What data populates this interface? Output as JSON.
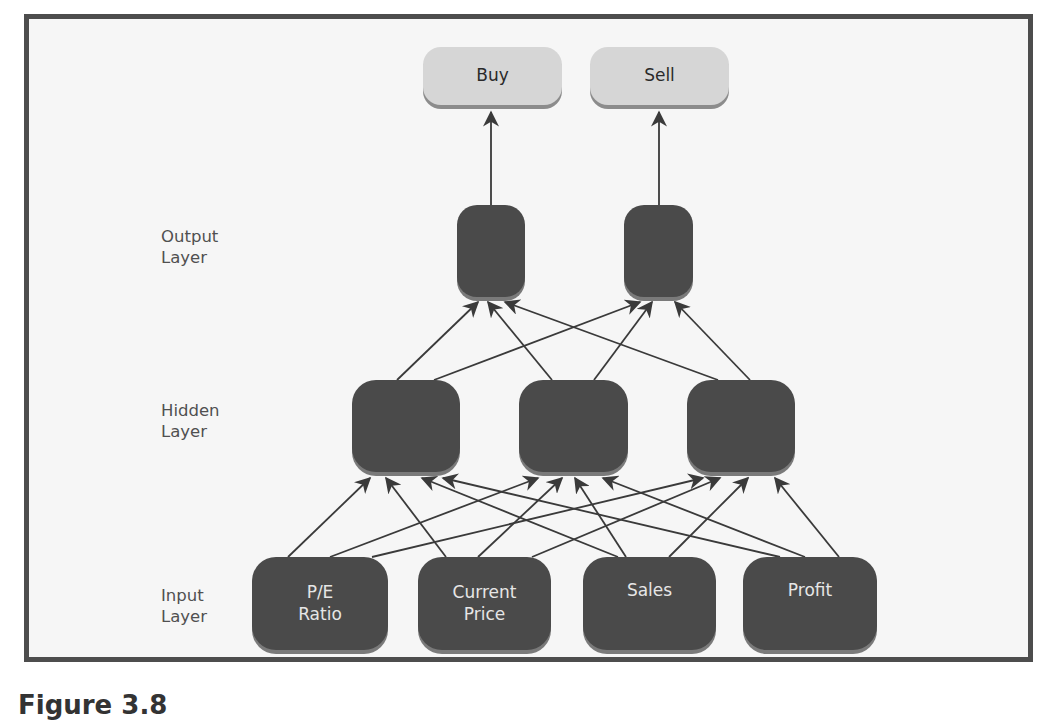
{
  "diagram": {
    "layers": {
      "output_label": [
        "Output",
        "Layer"
      ],
      "hidden_label": [
        "Hidden",
        "Layer"
      ],
      "input_label": [
        "Input",
        "Layer"
      ]
    },
    "decisions": [
      {
        "label": "Buy"
      },
      {
        "label": "Sell"
      }
    ],
    "output_nodes": [
      {
        "id": "o1",
        "label": ""
      },
      {
        "id": "o2",
        "label": ""
      }
    ],
    "hidden_nodes": [
      {
        "id": "h1",
        "label": ""
      },
      {
        "id": "h2",
        "label": ""
      },
      {
        "id": "h3",
        "label": ""
      }
    ],
    "input_nodes": [
      {
        "id": "i1",
        "label_lines": [
          "P/E",
          "Ratio"
        ]
      },
      {
        "id": "i2",
        "label_lines": [
          "Current",
          "Price"
        ]
      },
      {
        "id": "i3",
        "label_lines": [
          "Sales",
          ""
        ]
      },
      {
        "id": "i4",
        "label_lines": [
          "Profit",
          ""
        ]
      }
    ],
    "connections": "fully connected: each input -> each hidden; each hidden -> each output; output o1 -> Buy, o2 -> Sell",
    "colors": {
      "frame_border": "#4d4d4d",
      "background": "#f6f6f6",
      "node_dark": "#4a4a4a",
      "node_light": "#d6d6d6",
      "edge": "#3a3a3a"
    }
  },
  "caption": "Figure 3.8"
}
